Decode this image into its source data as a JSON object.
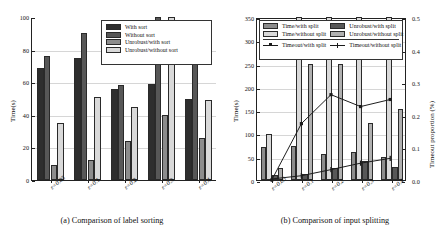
{
  "figure": {
    "panels": [
      "a",
      "b"
    ]
  },
  "panel_a": {
    "caption": "(a) Comparison of label sorting",
    "legend": {
      "items": [
        {
          "label": "With sort",
          "fill": "#2e2e2e"
        },
        {
          "label": "Without sort",
          "fill": "#575757"
        },
        {
          "label": "Unrobust/with sort",
          "fill": "#8c8c8c"
        },
        {
          "label": "Unrobust/without sort",
          "fill": "#d9d9d9"
        }
      ]
    },
    "chart_data": {
      "type": "bar",
      "title": "",
      "xlabel": "",
      "ylabel": "Time(s)",
      "ylim": [
        0,
        100
      ],
      "yticks": [
        0,
        20,
        40,
        60,
        80,
        100
      ],
      "grid": true,
      "legend_position": "top-right",
      "categories": [
        "ε=0.05",
        "ε=0.1",
        "ε=0.2",
        "ε=0.3",
        "ε=0.4"
      ],
      "series": [
        {
          "name": "With sort",
          "values": [
            69,
            75,
            56,
            59,
            50
          ]
        },
        {
          "name": "Without sort",
          "values": [
            76,
            90,
            58,
            100,
            71
          ]
        },
        {
          "name": "Unrobust/with sort",
          "values": [
            9,
            12,
            24,
            40,
            26
          ]
        },
        {
          "name": "Unrobust/without sort",
          "values": [
            35,
            51,
            45,
            100,
            49
          ]
        }
      ]
    }
  },
  "panel_b": {
    "caption": "(b) Comparison of input splitting",
    "legend": {
      "bars": [
        {
          "label": "Time/with split",
          "fill": "#8c8c8c"
        },
        {
          "label": "Time/without split",
          "fill": "#d9d9d9"
        },
        {
          "label": "Unrobust/with split",
          "fill": "#575757"
        },
        {
          "label": "Unrobust/without split",
          "fill": "#b0b0b0"
        }
      ],
      "lines": [
        {
          "label": "Timeout/with split",
          "marker": "square"
        },
        {
          "label": "Timeout/without split",
          "marker": "bar"
        }
      ]
    },
    "chart_data": {
      "type": "bar",
      "title": "",
      "xlabel": "",
      "ylabel": "Time(s)",
      "y2label": "Timeout proportion (%)",
      "ylim": [
        0,
        350
      ],
      "yticks": [
        0,
        50,
        100,
        150,
        200,
        250,
        300,
        350
      ],
      "y2lim": [
        0.0,
        0.5
      ],
      "y2ticks": [
        0.0,
        0.1,
        0.2,
        0.3,
        0.4,
        0.5
      ],
      "grid": true,
      "legend_position": "top",
      "categories": [
        "ε=0.05",
        "ε=0.1",
        "ε=0.2",
        "ε=0.3",
        "ε=0.4"
      ],
      "series": [
        {
          "name": "Time/with split",
          "values": [
            70,
            74,
            56,
            60,
            50
          ],
          "axis": "left"
        },
        {
          "name": "Time/without split",
          "values": [
            99,
            350,
            350,
            350,
            350
          ],
          "axis": "left"
        },
        {
          "name": "Unrobust/with split",
          "values": [
            11,
            12,
            25,
            41,
            28
          ],
          "axis": "left"
        },
        {
          "name": "Unrobust/without split",
          "values": [
            26,
            250,
            250,
            122,
            153
          ],
          "axis": "left"
        },
        {
          "name": "Timeout/with split",
          "values": [
            0.0,
            0.175,
            0.265,
            0.228,
            0.25
          ],
          "axis": "right",
          "kind": "line"
        },
        {
          "name": "Timeout/without split",
          "values": [
            0.003,
            0.013,
            0.032,
            0.052,
            0.067
          ],
          "axis": "right",
          "kind": "line"
        }
      ]
    }
  }
}
